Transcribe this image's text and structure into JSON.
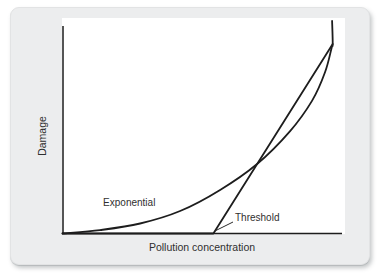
{
  "figure": {
    "description_visible_text_only": "",
    "background": "card"
  },
  "colors": {
    "card_bg": "#ecedee",
    "plot_bg": "#ffffff",
    "line": "#1d1d1d",
    "text": "#2f2f2f"
  },
  "chart_data": {
    "type": "line",
    "title": "",
    "xlabel": "Pollution concentration",
    "ylabel": "Damage",
    "xlim": [
      0,
      100
    ],
    "ylim": [
      0,
      100
    ],
    "grid": false,
    "ticks": false,
    "legend_position": "none (labels annotated on curves)",
    "series": [
      {
        "name": "Exponential",
        "smooth": true,
        "points": [
          [
            0,
            0
          ],
          [
            13.4,
            1.6
          ],
          [
            27.7,
            4.7
          ],
          [
            42,
            10.6
          ],
          [
            56.3,
            20.5
          ],
          [
            69.5,
            32.7
          ],
          [
            81.3,
            48.2
          ],
          [
            89.1,
            62.4
          ],
          [
            93.8,
            76
          ],
          [
            96.1,
            87.3
          ],
          [
            96.5,
            89.2
          ],
          [
            96.3,
            100
          ]
        ]
      },
      {
        "name": "Threshold",
        "smooth": false,
        "points": [
          [
            0,
            0
          ],
          [
            53.9,
            0
          ],
          [
            96.5,
            89.2
          ]
        ]
      }
    ],
    "curve_labels": [
      {
        "text": "Exponential",
        "anchor": [
          14.5,
          14.4
        ],
        "align": "start"
      },
      {
        "text": "Threshold",
        "anchor": [
          61.6,
          7.1
        ],
        "align": "start"
      }
    ],
    "threshold_leader": {
      "from": [
        54.5,
        1.2
      ],
      "to": [
        60.9,
        5.4
      ]
    },
    "annotations_notes": "Two damage-response curves cross once mid-plot and converge at top right; Threshold curve is flat at zero until the threshold point on the x-axis."
  }
}
